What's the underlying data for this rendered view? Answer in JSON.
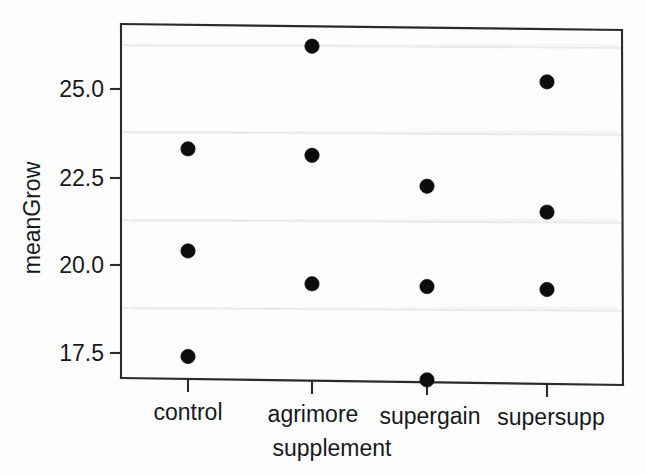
{
  "chart_data": {
    "type": "scatter",
    "title": "",
    "xlabel": "supplement",
    "ylabel": "meanGrow",
    "categories": [
      "control",
      "agrimore",
      "supergain",
      "supersupp"
    ],
    "x_tick_labels": [
      "control",
      "agrimore",
      "supergain",
      "supersupp"
    ],
    "y_tick_labels": [
      "17.5",
      "20.0",
      "22.5",
      "25.0"
    ],
    "y_ticks": [
      17.5,
      20.0,
      22.5,
      25.0
    ],
    "ylim": [
      16.3,
      26.8
    ],
    "grid": true,
    "legend": "none",
    "marker": "filled-circle",
    "marker_color": "#0c0c0d",
    "points": [
      {
        "category": "control",
        "x_index": 0,
        "values": [
          23.3,
          20.4,
          17.4
        ]
      },
      {
        "category": "agrimore",
        "x_index": 1,
        "values": [
          26.25,
          23.15,
          19.5
        ]
      },
      {
        "category": "supergain",
        "x_index": 2,
        "values": [
          22.3,
          19.45,
          16.8
        ]
      },
      {
        "category": "supersupp",
        "x_index": 3,
        "values": [
          25.3,
          21.6,
          19.4
        ]
      }
    ],
    "series": [
      {
        "name": "upper",
        "categories": [
          "control",
          "agrimore",
          "supergain",
          "supersupp"
        ],
        "values": [
          23.3,
          26.25,
          22.3,
          25.3
        ]
      },
      {
        "name": "middle",
        "categories": [
          "control",
          "agrimore",
          "supergain",
          "supersupp"
        ],
        "values": [
          20.4,
          23.15,
          19.45,
          21.6
        ]
      },
      {
        "name": "lower",
        "categories": [
          "control",
          "agrimore",
          "supergain",
          "supersupp"
        ],
        "values": [
          17.4,
          19.5,
          16.8,
          19.4
        ]
      }
    ]
  },
  "axes": {
    "y_title": "meanGrow",
    "x_title": "supplement",
    "y_tick_0": "17.5",
    "y_tick_1": "20.0",
    "y_tick_2": "22.5",
    "y_tick_3": "25.0",
    "x_tick_0": "control",
    "x_tick_1": "agrimore",
    "x_tick_2": "supergain",
    "x_tick_3": "supersupp"
  }
}
